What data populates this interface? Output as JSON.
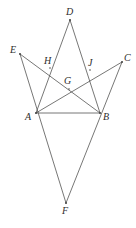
{
  "figure": {
    "background_color": "#ffffff",
    "line_color": "#4a4a48",
    "label_color": "#2e2e2c",
    "width": 136,
    "height": 228,
    "points": [
      {
        "id": "A",
        "label": "A",
        "x": 36,
        "y": 113,
        "label_x": 25,
        "label_y": 112,
        "kind": "vertex"
      },
      {
        "id": "B",
        "label": "B",
        "x": 100,
        "y": 113,
        "label_x": 103,
        "label_y": 112,
        "kind": "vertex"
      },
      {
        "id": "C",
        "label": "C",
        "x": 122,
        "y": 62,
        "label_x": 124,
        "label_y": 53,
        "kind": "vertex"
      },
      {
        "id": "D",
        "label": "D",
        "x": 70,
        "y": 20,
        "label_x": 66,
        "label_y": 7,
        "kind": "vertex"
      },
      {
        "id": "E",
        "label": "E",
        "x": 20,
        "y": 54,
        "label_x": 10,
        "label_y": 45,
        "kind": "vertex"
      },
      {
        "id": "F",
        "label": "F",
        "x": 66,
        "y": 203,
        "label_x": 62,
        "label_y": 206,
        "kind": "vertex"
      },
      {
        "id": "G",
        "label": "G",
        "x": 69,
        "y": 89,
        "label_x": 64,
        "label_y": 76,
        "kind": "intersection"
      },
      {
        "id": "H",
        "label": "H",
        "x": 50,
        "y": 68,
        "label_x": 44,
        "label_y": 56,
        "kind": "intersection"
      },
      {
        "id": "J",
        "label": "J",
        "x": 90,
        "y": 70,
        "label_x": 88,
        "label_y": 58,
        "kind": "intersection"
      }
    ],
    "segments": [
      {
        "id": "seg-E-F",
        "from": "E",
        "to": "F",
        "through": [
          "A"
        ],
        "description": "line E through A to F"
      },
      {
        "id": "seg-C-F",
        "from": "C",
        "to": "F",
        "through": [
          "B"
        ],
        "description": "line C through B to F"
      },
      {
        "id": "seg-E-B",
        "from": "E",
        "to": "B",
        "through": [
          "H",
          "G"
        ],
        "description": "line E to B crossing H and G"
      },
      {
        "id": "seg-C-A",
        "from": "C",
        "to": "A",
        "through": [
          "J",
          "G"
        ],
        "description": "line C to A crossing J and G"
      },
      {
        "id": "seg-D-A",
        "from": "D",
        "to": "A",
        "through": [
          "H"
        ],
        "description": "line D to A crossing H"
      },
      {
        "id": "seg-D-B",
        "from": "D",
        "to": "B",
        "through": [
          "J"
        ],
        "description": "line D to B crossing J"
      },
      {
        "id": "seg-A-B",
        "from": "A",
        "to": "B",
        "through": [],
        "description": "base segment A to B"
      }
    ]
  }
}
